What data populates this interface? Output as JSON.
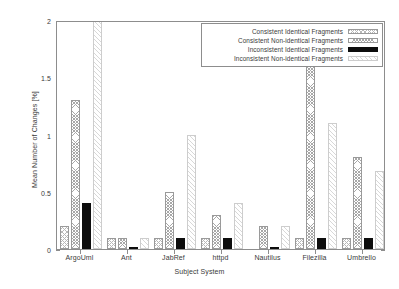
{
  "chart_data": {
    "type": "bar",
    "title": "",
    "xlabel": "Subject System",
    "ylabel": "Mean Number of Changes [%]",
    "ylim": [
      0,
      2
    ],
    "yticks": [
      0,
      0.5,
      1,
      1.5,
      2
    ],
    "ytick_labels": [
      "0",
      "0.5",
      "1",
      "1.5",
      "2"
    ],
    "grid": false,
    "legend_position": "top-right",
    "categories": [
      "ArgoUml",
      "Ant",
      "JabRef",
      "httpd",
      "Nautilus",
      "Filezilla",
      "Umbrello"
    ],
    "series": [
      {
        "name": "Consistent Identical Fragments",
        "pattern": "cross-hatch",
        "values": [
          0.2,
          0.1,
          0.1,
          0.1,
          0.0,
          0.1,
          0.1
        ]
      },
      {
        "name": "Consistent Non-identical Fragments",
        "pattern": "dense-cross-hatch",
        "values": [
          1.3,
          0.1,
          0.5,
          0.3,
          0.2,
          1.7,
          0.8
        ]
      },
      {
        "name": "Inconsistent Identical Fragments",
        "pattern": "solid-black",
        "values": [
          0.4,
          0.02,
          0.1,
          0.1,
          0.01,
          0.1,
          0.1
        ]
      },
      {
        "name": "Inconsistent Non-identical Fragments",
        "pattern": "light-diagonal",
        "values": [
          2.0,
          0.1,
          1.0,
          0.4,
          0.2,
          1.1,
          0.68
        ]
      }
    ]
  }
}
